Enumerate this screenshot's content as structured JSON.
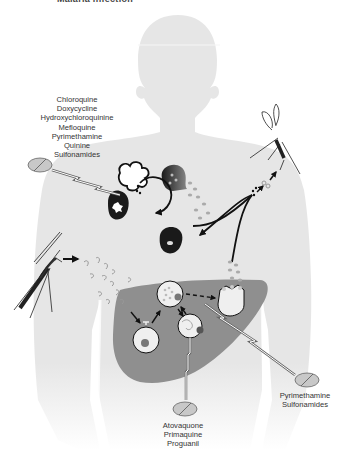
{
  "figure": {
    "title_partial": "Malaria infection",
    "colors": {
      "body": "#e6e6e6",
      "liver": "#8f8f8f",
      "cell_fill": "#efefef",
      "dark_cell": "#1a1a1a",
      "arrow": "#111111",
      "pill": "#c8c8c8",
      "text": "#333333"
    }
  },
  "labels": {
    "blood_stage_drugs": [
      "Chloroquine",
      "Doxycycline",
      "Hydroxychloroquinine",
      "Mefloquine",
      "Pyrimethamine",
      "Quinine",
      "Sulfonamides"
    ],
    "liver_schizont_drugs": [
      "Pyrimethamine",
      "Sulfonamides"
    ],
    "liver_stage_drugs": [
      "Atovaquone",
      "Primaquine",
      "Proguanil"
    ]
  },
  "icons": {
    "pill_blood": "pill-icon",
    "pill_liver_late": "pill-icon",
    "pill_liver_early": "pill-icon",
    "mosquito_biting": "mosquito-icon",
    "mosquito_feeding": "mosquito-icon"
  }
}
